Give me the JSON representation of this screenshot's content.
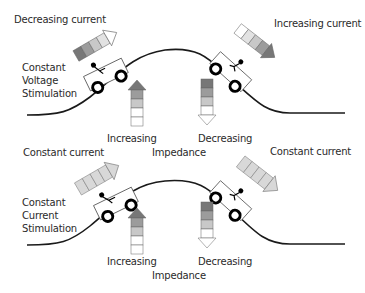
{
  "panels": [
    {
      "id": "voltage",
      "mode_label": [
        "Constant",
        "Voltage",
        "Stimulation"
      ],
      "left_current_label": "Decreasing current",
      "right_current_label": "Increasing current",
      "impedance_left": "Increasing",
      "impedance_right": "Decreasing",
      "impedance_label": "Impedance"
    },
    {
      "id": "current",
      "mode_label": [
        "Constant",
        "Current",
        "Stimulation"
      ],
      "left_current_label": "Constant current",
      "right_current_label": "Constant current",
      "impedance_left": "Increasing",
      "impedance_right": "Decreasing",
      "impedance_label": "Impedance"
    }
  ],
  "colors": {
    "dark": "#777777",
    "mid": "#9c9c9c",
    "light": "#c8c8c8",
    "pale": "#e2e2e2",
    "white": "#ffffff",
    "constant": "#d8d8d8",
    "stroke": "#555555",
    "curve": "#1a1a1a"
  }
}
